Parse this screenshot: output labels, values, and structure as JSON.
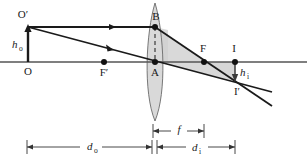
{
  "figure": {
    "kind": "ray-diagram",
    "background_color": "#ffffff",
    "line_color": "#1a1a1a",
    "axis_color": "#555555",
    "lens_fill": "#d9d9d9",
    "shade_fill": "#cfcfcf",
    "width": 307,
    "height": 160
  },
  "labels": {
    "object_top": "O′",
    "object_base": "O",
    "object_height": "h",
    "object_height_sub": "o",
    "near_focal": "F′",
    "lens_top_point": "B",
    "lens_center_point": "A",
    "far_focal": "F",
    "image_base": "I",
    "image_tip": "I′",
    "image_height": "h",
    "image_height_sub": "i",
    "object_distance": "d",
    "object_distance_sub": "o",
    "image_distance": "d",
    "image_distance_sub": "i",
    "focal_length": "f"
  },
  "geometry": {
    "axis_y": 62,
    "axis_x_start": 0,
    "axis_x_end": 307,
    "object_x": 28,
    "object_tip_y": 27,
    "lens_x": 155,
    "lens_top_y": 3,
    "lens_bottom_y": 121,
    "lens_half_width": 13,
    "near_focal_x": 104,
    "far_focal_x": 204,
    "image_x": 235,
    "image_tip_y": 81,
    "ray_end_x": 272
  },
  "dimensions": {
    "focal_length_line_y": 131,
    "focal_length_from_x": 153,
    "focal_length_to_x": 204,
    "main_line_y": 147,
    "object_distance_from_x": 27,
    "object_distance_to_x": 152,
    "image_distance_from_x": 157,
    "image_distance_to_x": 235
  },
  "points": [
    {
      "name": "B",
      "x": 155,
      "y": 27
    },
    {
      "name": "A",
      "x": 155,
      "y": 62
    },
    {
      "name": "F-prime",
      "x": 104,
      "y": 62
    },
    {
      "name": "F",
      "x": 204,
      "y": 62
    },
    {
      "name": "I",
      "x": 235,
      "y": 62
    }
  ]
}
